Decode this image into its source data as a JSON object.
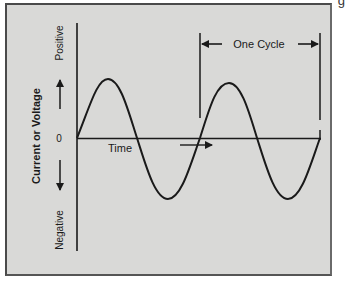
{
  "figure": {
    "caption_fragment": "g",
    "y_axis": {
      "label": "Current or Voltage",
      "positive_label": "Positive",
      "negative_label": "Negative",
      "zero_label": "0"
    },
    "x_axis": {
      "label": "Time"
    },
    "annotation": {
      "cycle_label": "One Cycle"
    },
    "colors": {
      "background": "#d9d9d7",
      "line": "#1a1a1a",
      "border": "#4a4a4a"
    },
    "wave": {
      "type": "sine",
      "cycles_shown": 2
    }
  }
}
